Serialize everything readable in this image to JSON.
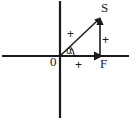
{
  "figure": {
    "background_color": "#ffffff",
    "stroke_color": "#1a1a1a",
    "width": 131,
    "height": 119
  },
  "axes": {
    "horizontal": {
      "name": "x-axis",
      "y": 56,
      "x_start": 2,
      "x_end": 129
    },
    "vertical": {
      "name": "y-axis",
      "x": 60,
      "y_start": 1,
      "y_end": 118
    },
    "origin": {
      "label": "0",
      "x": 60,
      "y": 56
    }
  },
  "vectors": [
    {
      "name": "resultant-vector",
      "label": "S",
      "from": [
        60,
        56
      ],
      "to": [
        100,
        18
      ],
      "kind": "diagonal"
    },
    {
      "name": "vertical-component-vector",
      "label": "",
      "from": [
        100,
        56
      ],
      "to": [
        100,
        18
      ],
      "kind": "vertical"
    },
    {
      "name": "horizontal-force-vector",
      "label": "F",
      "from": [
        60,
        56
      ],
      "to": [
        102,
        56
      ],
      "kind": "horizontal"
    }
  ],
  "angle": {
    "name": "angle-alpha",
    "label": "α",
    "vertex": [
      60,
      56
    ],
    "arc_radius": 14
  },
  "marks": {
    "diagonal_plus": "+",
    "vertical_plus": "+",
    "horizontal_plus": "+"
  }
}
